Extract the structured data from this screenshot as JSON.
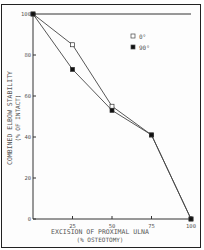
{
  "chart_data": {
    "type": "line",
    "title": "",
    "xlabel": "EXCISION OF PROXIMAL ULNA",
    "xlabel_sub": "(% OSTEOTOMY)",
    "ylabel": "COMBINED ELBOW STABILITY",
    "ylabel_sub": "(% OF INTACT)",
    "x": [
      0,
      25,
      50,
      75,
      100
    ],
    "xticks": [
      "25",
      "50",
      "75",
      "100"
    ],
    "yticks": [
      "0",
      "20",
      "40",
      "60",
      "80",
      "100"
    ],
    "xlim": [
      0,
      100
    ],
    "ylim": [
      0,
      100
    ],
    "grid": false,
    "legend_position": "upper right",
    "series": [
      {
        "name": "0°",
        "marker": "open-square",
        "values": [
          100,
          85,
          55,
          41,
          0
        ]
      },
      {
        "name": "90°",
        "marker": "filled-square",
        "values": [
          100,
          73,
          53,
          41,
          0
        ]
      }
    ]
  }
}
